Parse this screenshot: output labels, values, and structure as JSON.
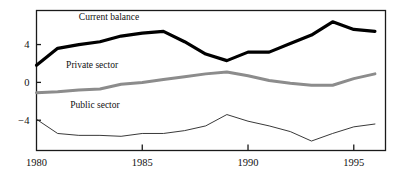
{
  "chart_data": {
    "type": "line",
    "title": "",
    "xlabel": "",
    "ylabel": "",
    "xlim": [
      1980,
      1996.5
    ],
    "ylim": [
      -7.2,
      7.6
    ],
    "grid": false,
    "legend_position": "inline-annotations",
    "x_ticks": [
      1980,
      1985,
      1990,
      1995
    ],
    "x_tick_labels": [
      "1980",
      "1985",
      "1990",
      "1995"
    ],
    "y_ticks": [
      4,
      0,
      -4
    ],
    "y_tick_labels": [
      "4",
      "0",
      "−4"
    ],
    "x": [
      1980,
      1981,
      1982,
      1983,
      1984,
      1985,
      1986,
      1987,
      1988,
      1989,
      1990,
      1991,
      1992,
      1993,
      1994,
      1995,
      1996
    ],
    "series": [
      {
        "name": "Current balance",
        "color": "#000000",
        "width": 3.2,
        "values": [
          1.8,
          3.6,
          4.0,
          4.3,
          4.9,
          5.2,
          5.4,
          4.3,
          3.0,
          2.3,
          3.2,
          3.2,
          4.1,
          5.0,
          6.4,
          5.6,
          5.4
        ]
      },
      {
        "name": "Private sector",
        "color": "#8c8c8c",
        "width": 3.0,
        "values": [
          -1.1,
          -1.0,
          -0.8,
          -0.7,
          -0.2,
          0.0,
          0.3,
          0.6,
          0.9,
          1.1,
          0.7,
          0.2,
          -0.1,
          -0.3,
          -0.3,
          0.4,
          0.9
        ]
      },
      {
        "name": "Public sector",
        "color": "#222222",
        "width": 0.9,
        "values": [
          -3.9,
          -5.4,
          -5.6,
          -5.6,
          -5.7,
          -5.4,
          -5.4,
          -5.1,
          -4.6,
          -3.4,
          -4.1,
          -4.6,
          -5.2,
          -6.2,
          -5.4,
          -4.7,
          -4.4
        ]
      }
    ],
    "annotations": [
      {
        "text": "Current balance",
        "x": 1982.0,
        "y": 6.6
      },
      {
        "text": "Private sector",
        "x": 1981.4,
        "y": 1.5
      },
      {
        "text": "Public sector",
        "x": 1981.6,
        "y": -2.7
      }
    ]
  }
}
